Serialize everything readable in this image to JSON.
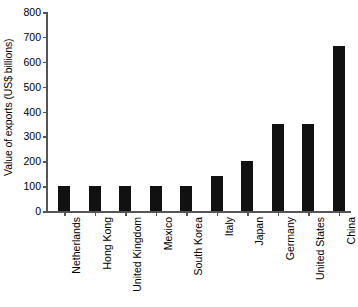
{
  "chart_data": {
    "type": "bar",
    "title": "",
    "subtitle": "",
    "xlabel": "",
    "ylabel": "Value of exports (US$ billions)",
    "categories": [
      "Netherlands",
      "Hong Kong",
      "United Kingdom",
      "Mexico",
      "South Korea",
      "Italy",
      "Japan",
      "Germany",
      "United States",
      "China"
    ],
    "values": [
      100,
      100,
      100,
      100,
      100,
      140,
      200,
      348,
      348,
      665
    ],
    "ylim": [
      0,
      800
    ],
    "ytick_values": [
      0,
      100,
      200,
      300,
      400,
      500,
      600,
      700,
      800
    ],
    "ytick_labels": [
      "0",
      "100",
      "200",
      "300",
      "400",
      "500",
      "600",
      "700",
      "800"
    ],
    "grid": false,
    "legend": false,
    "legend_position": "none",
    "bar_color": "#111111",
    "axis_color": "#555555",
    "background_color": "#ffffff"
  }
}
